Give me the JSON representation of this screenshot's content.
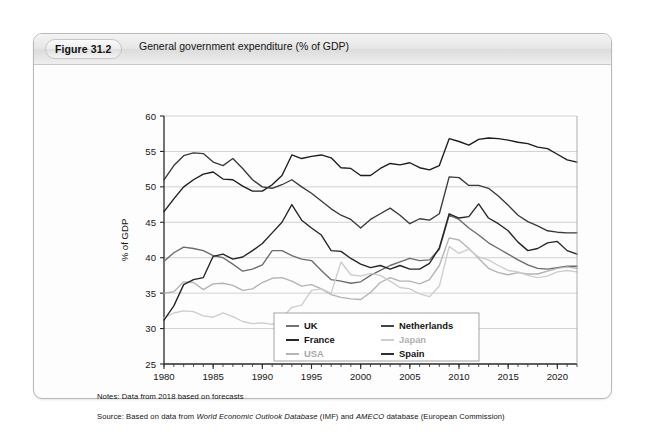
{
  "figure": {
    "number": "Figure 31.2",
    "caption": "General government expenditure (% of GDP)"
  },
  "notes": {
    "notes_label": "Notes:",
    "notes_text": " Data from 2018 based on forecasts",
    "source_label": "Source:",
    "source_pre": " Based on data from ",
    "source_italic_1": "World Economic Outlook Database",
    "source_mid": " (IMF) and ",
    "source_italic_2": "AMECO",
    "source_post": " database (European Commission)"
  },
  "chart_data": {
    "type": "line",
    "title": "General government expenditure (% of GDP)",
    "xlabel": "",
    "ylabel": "% of GDP",
    "xlim": [
      1980,
      2022
    ],
    "ylim": [
      25,
      60
    ],
    "yticks": [
      25,
      30,
      35,
      40,
      45,
      50,
      55,
      60
    ],
    "xticks": [
      1980,
      1985,
      1990,
      1995,
      2000,
      2005,
      2010,
      2015,
      2020
    ],
    "minor_xtick_step": 1,
    "grid": "horizontal",
    "legend_position": "bottom-right",
    "x": [
      1980,
      1981,
      1982,
      1983,
      1984,
      1985,
      1986,
      1987,
      1988,
      1989,
      1990,
      1991,
      1992,
      1993,
      1994,
      1995,
      1996,
      1997,
      1998,
      1999,
      2000,
      2001,
      2002,
      2003,
      2004,
      2005,
      2006,
      2007,
      2008,
      2009,
      2010,
      2011,
      2012,
      2013,
      2014,
      2015,
      2016,
      2017,
      2018,
      2019,
      2020,
      2021,
      2022
    ],
    "series": [
      {
        "name": "UK",
        "color": "#6b6b6b",
        "values": [
          39.5,
          40.7,
          41.5,
          41.3,
          41.0,
          40.3,
          40.0,
          39.1,
          38.1,
          38.4,
          39.0,
          41.0,
          41.0,
          40.3,
          39.8,
          39.6,
          38.2,
          36.9,
          36.7,
          36.4,
          36.6,
          37.5,
          38.2,
          38.9,
          39.4,
          39.9,
          39.6,
          39.7,
          41.2,
          46.0,
          45.4,
          44.2,
          43.2,
          42.1,
          41.3,
          40.5,
          39.7,
          39.0,
          38.5,
          38.4,
          38.6,
          38.8,
          38.8
        ]
      },
      {
        "name": "France",
        "color": "#1c1c1c",
        "values": [
          46.5,
          48.3,
          50.0,
          51.0,
          51.8,
          52.1,
          51.1,
          51.0,
          50.1,
          49.4,
          49.4,
          50.3,
          51.6,
          54.5,
          54.0,
          54.3,
          54.5,
          54.1,
          52.7,
          52.6,
          51.6,
          51.6,
          52.6,
          53.3,
          53.1,
          53.4,
          52.7,
          52.4,
          53.0,
          56.8,
          56.4,
          55.9,
          56.7,
          56.9,
          56.8,
          56.6,
          56.3,
          56.1,
          55.6,
          55.4,
          54.6,
          53.8,
          53.5
        ]
      },
      {
        "name": "USA",
        "color": "#b3b3b3",
        "values": [
          35.0,
          35.2,
          36.6,
          36.5,
          35.5,
          36.3,
          36.4,
          36.1,
          35.4,
          35.6,
          36.5,
          37.1,
          37.2,
          36.7,
          36.0,
          36.2,
          35.6,
          34.8,
          34.4,
          34.2,
          34.1,
          35.1,
          36.5,
          37.2,
          36.7,
          36.7,
          36.3,
          36.9,
          38.9,
          42.8,
          42.5,
          41.3,
          39.9,
          38.5,
          37.9,
          37.6,
          37.9,
          37.7,
          37.7,
          38.1,
          38.5,
          38.7,
          38.5
        ]
      },
      {
        "name": "Netherlands",
        "color": "#3a3a3a",
        "values": [
          51.0,
          53.0,
          54.4,
          54.8,
          54.7,
          53.5,
          53.0,
          54.0,
          52.6,
          51.0,
          50.0,
          49.8,
          50.3,
          51.0,
          50.0,
          49.1,
          48.0,
          46.9,
          46.0,
          45.4,
          44.2,
          45.4,
          46.2,
          47.0,
          46.0,
          44.8,
          45.5,
          45.3,
          46.2,
          51.4,
          51.3,
          50.2,
          50.2,
          49.8,
          48.7,
          47.4,
          46.0,
          45.1,
          44.5,
          43.8,
          43.6,
          43.5,
          43.5
        ]
      },
      {
        "name": "Japan",
        "color": "#cdcdcd",
        "values": [
          31.5,
          32.2,
          32.5,
          32.4,
          31.8,
          31.6,
          32.2,
          31.7,
          31.0,
          30.7,
          30.8,
          30.6,
          31.5,
          33.0,
          33.3,
          35.4,
          35.6,
          35.0,
          39.4,
          37.6,
          37.4,
          37.8,
          37.5,
          36.7,
          35.8,
          35.6,
          34.9,
          34.5,
          36.0,
          41.6,
          40.6,
          41.2,
          40.1,
          39.7,
          38.9,
          38.2,
          38.0,
          37.5,
          37.2,
          37.4,
          38.0,
          38.2,
          38.0
        ]
      },
      {
        "name": "Spain",
        "color": "#242424",
        "values": [
          31.2,
          33.2,
          36.2,
          36.9,
          37.2,
          40.2,
          40.5,
          39.8,
          40.1,
          41.0,
          42.0,
          43.5,
          45.0,
          47.5,
          45.3,
          44.2,
          43.2,
          41.0,
          40.9,
          39.9,
          39.1,
          38.6,
          38.9,
          38.4,
          38.9,
          38.4,
          38.4,
          39.2,
          41.4,
          46.2,
          45.6,
          45.8,
          47.6,
          45.6,
          44.8,
          43.8,
          42.2,
          41.0,
          41.3,
          42.1,
          42.3,
          41.0,
          40.5
        ]
      }
    ],
    "legend": [
      {
        "label": "UK",
        "color": "#6b6b6b"
      },
      {
        "label": "Netherlands",
        "color": "#3a3a3a"
      },
      {
        "label": "France",
        "color": "#1c1c1c"
      },
      {
        "label": "Japan",
        "color": "#cdcdcd"
      },
      {
        "label": "USA",
        "color": "#b3b3b3"
      },
      {
        "label": "Spain",
        "color": "#242424"
      }
    ]
  }
}
